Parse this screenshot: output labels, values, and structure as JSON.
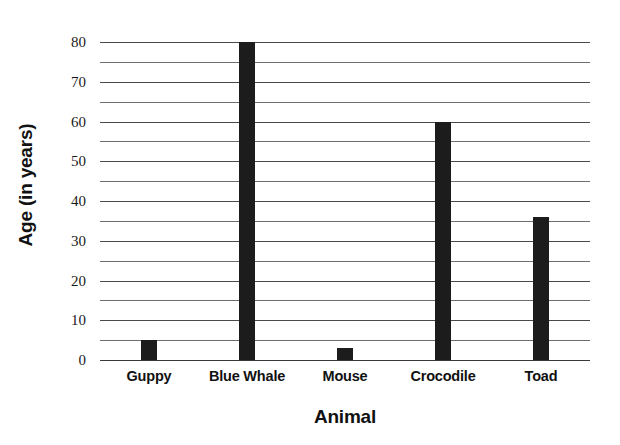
{
  "chart_data": {
    "type": "bar",
    "title": "",
    "subtitle": "",
    "xlabel": "Animal",
    "ylabel": "Age (in years)",
    "categories": [
      "Guppy",
      "Blue Whale",
      "Mouse",
      "Crocodile",
      "Toad"
    ],
    "values": [
      5,
      80,
      3,
      60,
      36
    ],
    "ylim": [
      0,
      80
    ],
    "y_major_ticks": [
      0,
      10,
      20,
      30,
      40,
      50,
      60,
      70,
      80
    ],
    "y_major_tick_labels": [
      "0",
      "10",
      "20",
      "30",
      "40",
      "50",
      "60",
      "70",
      "80"
    ],
    "y_minor_ticks": [
      5,
      15,
      25,
      35,
      45,
      55,
      65,
      75
    ],
    "grid": true,
    "grid_axis": "y",
    "legend": false,
    "legend_position": "none",
    "bar_color": "#1c1c1c",
    "gridline_color": "#6e6e6e",
    "background_color": "#ffffff",
    "bars": [
      {
        "category": "Guppy",
        "value": 5
      },
      {
        "category": "Blue Whale",
        "value": 80
      },
      {
        "category": "Mouse",
        "value": 3
      },
      {
        "category": "Crocodile",
        "value": 60
      },
      {
        "category": "Toad",
        "value": 36
      }
    ]
  }
}
